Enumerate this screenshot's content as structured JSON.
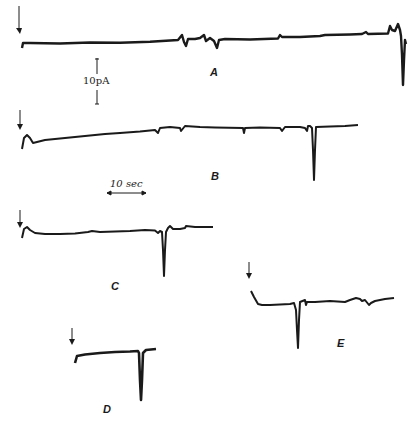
{
  "figure": {
    "panels": [
      {
        "id": "A",
        "label": "A"
      },
      {
        "id": "B",
        "label": "B"
      },
      {
        "id": "C",
        "label": "C"
      },
      {
        "id": "D",
        "label": "D"
      },
      {
        "id": "E",
        "label": "E"
      }
    ],
    "scale_bars": {
      "current": {
        "label": "10pA",
        "value": 10,
        "unit": "pA"
      },
      "time": {
        "label": "10 sec",
        "value": 10,
        "unit": "sec"
      }
    },
    "trace_color": "#1a1a1a",
    "background": "#ffffff"
  }
}
